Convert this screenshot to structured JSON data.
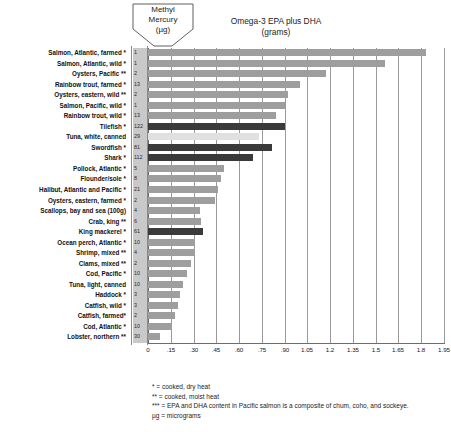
{
  "header": {
    "mercury_label_line1": "Methyl",
    "mercury_label_line2": "Mercury",
    "mercury_label_line3": "(µg)",
    "chart_title_line1": "Omega-3 EPA plus DHA",
    "chart_title_line2": "(grams)"
  },
  "footnotes": [
    "* = cooked, dry heat",
    "** = cooked, moist heat",
    "*** = EPA and DHA content in Pacific salmon is a composite of chum, coho, and sockeye.",
    "µg = micrograms"
  ],
  "colors": {
    "bar_low": "#9e9e9e",
    "bar_mid": "#e0e0e0",
    "bar_high": "#3a3a3a",
    "mercury_column": "#c9c9c9",
    "gridline": "#9a9a9a",
    "axis": "#6d6d6d",
    "text": "#111111",
    "background": "#ffffff"
  },
  "chart_data": {
    "type": "bar",
    "orientation": "horizontal",
    "title": "Omega-3 EPA plus DHA (grams)",
    "xlabel": "Omega-3 EPA plus DHA (grams)",
    "ylabel": "",
    "xlim": [
      0,
      1.95
    ],
    "grid": true,
    "legend": "none",
    "xticks": [
      "0",
      ".15",
      ".30",
      ".45",
      ".60",
      ".75",
      ".90",
      "1.05",
      "1.2",
      "1.35",
      "1.5",
      "1.65",
      "1.8",
      "1.95"
    ],
    "xtick_values": [
      0,
      0.15,
      0.3,
      0.45,
      0.6,
      0.75,
      0.9,
      1.05,
      1.2,
      1.35,
      1.5,
      1.65,
      1.8,
      1.95
    ],
    "secondary_axis": {
      "name": "Methyl Mercury (µg)",
      "units": "micrograms"
    },
    "categories": [
      "Salmon, Atlantic, farmed *",
      "Salmon, Atlantic, wild *",
      "Oysters, Pacific **",
      "Rainbow trout, farmed *",
      "Oysters, eastern, wild **",
      "Salmon, Pacific, wild *",
      "Rainbow trout, wild *",
      "Tilefish *",
      "Tuna, white, canned",
      "Swordfish *",
      "Shark *",
      "Pollock, Atlantic *",
      "Flounder/sole *",
      "Halibut, Atlantic and Pacific *",
      "Oysters, eastern, farmed *",
      "Scallops, bay and sea (100g)",
      "Crab, king **",
      "King mackerel *",
      "Ocean perch, Atlantic *",
      "Shrimp, mixed **",
      "Clams, mixed **",
      "Cod, Pacific *",
      "Tuna, light, canned",
      "Haddock *",
      "Catfish, wild *",
      "Catfish, farmed*",
      "Cod, Atlantic *",
      "Lobster, northern **"
    ],
    "series": [
      {
        "name": "Omega-3 EPA plus DHA (grams)",
        "values": [
          1.83,
          1.56,
          1.17,
          1.0,
          0.92,
          0.9,
          0.84,
          0.9,
          0.73,
          0.82,
          0.69,
          0.5,
          0.48,
          0.46,
          0.44,
          0.34,
          0.35,
          0.36,
          0.31,
          0.31,
          0.28,
          0.26,
          0.23,
          0.21,
          0.2,
          0.18,
          0.16,
          0.08
        ]
      },
      {
        "name": "Methyl Mercury (µg)",
        "values": [
          1,
          1,
          2,
          13,
          2,
          1,
          13,
          122,
          29,
          81,
          112,
          5,
          8,
          21,
          2,
          4,
          6,
          61,
          10,
          4,
          2,
          10,
          10,
          3,
          3,
          2,
          10,
          30
        ]
      }
    ],
    "bar_shade": [
      "lo",
      "lo",
      "lo",
      "lo",
      "lo",
      "lo",
      "lo",
      "hi",
      "mid",
      "hi",
      "hi",
      "lo",
      "lo",
      "lo",
      "lo",
      "lo",
      "lo",
      "hi",
      "lo",
      "lo",
      "lo",
      "lo",
      "lo",
      "lo",
      "lo",
      "lo",
      "lo",
      "lo"
    ]
  }
}
